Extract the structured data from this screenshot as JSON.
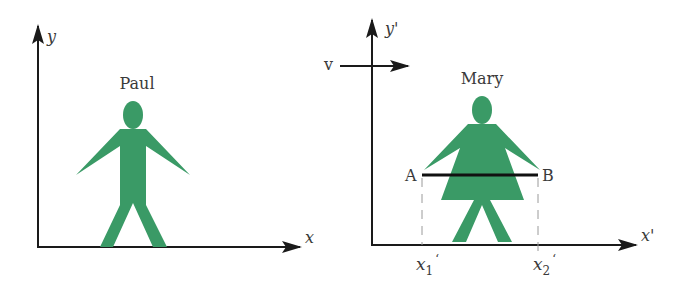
{
  "colors": {
    "figure_fill": "#3a9a66",
    "axis": "#1a1a1a",
    "text": "#3a3a3a",
    "dashed": "#9a9a9a"
  },
  "left_frame": {
    "x_axis_label": "x",
    "y_axis_label": "y",
    "figure_name": "Paul"
  },
  "right_frame": {
    "x_axis_label": "x'",
    "y_axis_label": "y'",
    "velocity_label": "v",
    "figure_name": "Mary",
    "point_a_label": "A",
    "point_b_label": "B",
    "x1_label": "x",
    "x1_sub": "1",
    "x1_prime": "‘",
    "x2_label": "x",
    "x2_sub": "2",
    "x2_prime": "‘"
  }
}
